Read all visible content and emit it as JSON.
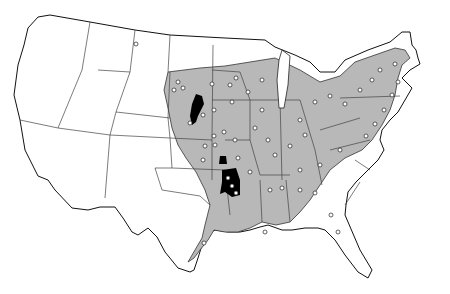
{
  "map": {
    "type": "species-distribution-range-map",
    "region": "Contiguous United States",
    "colors": {
      "background": "#ffffff",
      "range_fill": "#b8b8b8",
      "dense_area": "#000000",
      "state_border": "#111111",
      "record_dot": "#ffffff"
    },
    "legend": {
      "shaded": "species range",
      "black": "dense population areas",
      "dots": "record localities"
    }
  }
}
